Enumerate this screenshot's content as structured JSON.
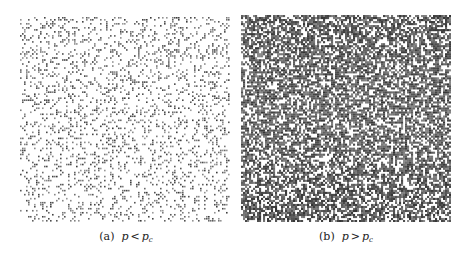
{
  "figure": {
    "panels": [
      {
        "id": "a",
        "label": "(a)",
        "variable": "p",
        "relation": "<",
        "threshold": "p",
        "threshold_sub": "c",
        "occupancy": 0.22,
        "grid_cols": 105,
        "grid_rows": 102,
        "dot_color": "#3a3a3a",
        "background": "#ffffff",
        "seed": 17
      },
      {
        "id": "b",
        "label": "(b)",
        "variable": "p",
        "relation": ">",
        "threshold": "p",
        "threshold_sub": "c",
        "occupancy": 0.64,
        "grid_cols": 105,
        "grid_rows": 103,
        "dot_color": "#333333",
        "background": "#ffffff",
        "seed": 91
      }
    ]
  }
}
